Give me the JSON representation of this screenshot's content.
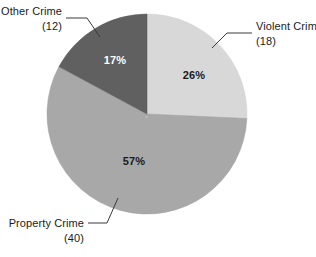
{
  "chart_data": {
    "type": "pie",
    "title": "",
    "subtitle": "",
    "xlabel": "",
    "ylabel": "",
    "legend_position": "none",
    "grid": false,
    "total": 70,
    "categories": [
      "Violent Crime",
      "Property Crime",
      "Other Crime"
    ],
    "values": [
      18,
      40,
      12
    ],
    "percent_values": [
      26,
      57,
      17
    ],
    "percent_labels": [
      "26%",
      "57%",
      "17%"
    ],
    "count_labels": [
      "(18)",
      "(40)",
      "(12)"
    ],
    "colors": [
      "#d8d8d8",
      "#a8a8a8",
      "#606060"
    ],
    "slices": [
      {
        "name": "Violent Crime",
        "value": 18,
        "count_label": "(18)",
        "percent": 26,
        "percent_label": "26%",
        "color": "#d8d8d8",
        "percent_text_color": "#1a1a1a",
        "start_angle": 0,
        "end_angle": 93.6
      },
      {
        "name": "Property Crime",
        "value": 40,
        "count_label": "(40)",
        "percent": 57,
        "percent_label": "57%",
        "color": "#a8a8a8",
        "percent_text_color": "#1a1a1a",
        "start_angle": 93.6,
        "end_angle": 298.8
      },
      {
        "name": "Other Crime",
        "value": 12,
        "count_label": "(12)",
        "percent": 17,
        "percent_label": "17%",
        "color": "#606060",
        "percent_text_color": "#ffffff",
        "start_angle": 298.8,
        "end_angle": 360
      }
    ]
  },
  "callouts": {
    "violent": {
      "name_line": "Violent Crime",
      "count_line": "(18)"
    },
    "other": {
      "name_line": "Other Crime",
      "count_line": "(12)"
    },
    "property": {
      "name_line": "Property Crime",
      "count_line": "(40)"
    }
  },
  "slice_percent_text": {
    "violent": "26%",
    "property": "57%",
    "other": "17%"
  },
  "style": {
    "background": "#ffffff",
    "leader_color": "#3a3a3a"
  }
}
